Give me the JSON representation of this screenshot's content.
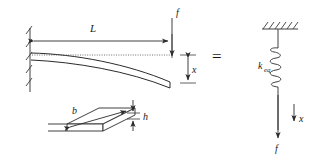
{
  "figure": {
    "background_color": "#ffffff",
    "line_color": "#2b2b2b"
  },
  "beam_model": {
    "length_label": "L",
    "force_label": "f",
    "deflection_label": "x",
    "support": "fixed-wall-hatched"
  },
  "cross_section": {
    "width_label": "b",
    "height_label": "h"
  },
  "equivalence": {
    "operator": "="
  },
  "spring_model": {
    "stiffness_label": "k",
    "stiffness_subscript": "eq",
    "displacement_label": "x",
    "force_label": "f",
    "support": "ceiling-hatched",
    "coil_turns": 5
  }
}
